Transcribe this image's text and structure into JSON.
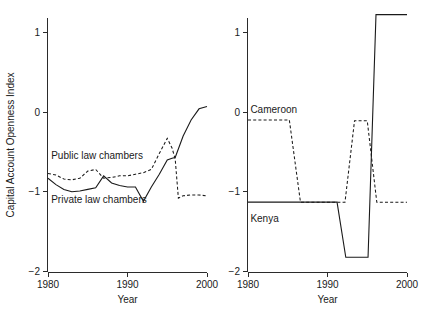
{
  "figure": {
    "width": 443,
    "height": 323,
    "background": "#ffffff",
    "line_color": "#1a1a1a"
  },
  "chart_data": [
    {
      "type": "line",
      "panel": "left",
      "title": "",
      "xlabel": "Year",
      "ylabel": "Capital Account Openness Index",
      "xlim": [
        1980,
        2000
      ],
      "ylim": [
        -2,
        1.35
      ],
      "xticks": [
        1980,
        1990,
        2000
      ],
      "xticklabels": [
        "1980",
        "1990",
        "2000"
      ],
      "yticks": [
        1,
        0,
        -1,
        -2
      ],
      "yticklabels": [
        "1",
        "0",
        "-1",
        "-2"
      ],
      "grid": false,
      "legend_position": "inline-annotations",
      "annotations": [
        {
          "text": "Public law chambers",
          "x": 1980.4,
          "y": -0.54,
          "anchor": "start"
        },
        {
          "text": "Private law chambers",
          "x": 1980.4,
          "y": -1.09,
          "anchor": "start"
        }
      ],
      "series": [
        {
          "name": "Public law chambers",
          "style": "dashed",
          "x": [
            1980,
            1981,
            1982,
            1983,
            1984,
            1985,
            1986,
            1987,
            1988,
            1989,
            1990,
            1991,
            1992,
            1993,
            1994,
            1995,
            1995.6,
            1996,
            1996.4,
            1997,
            1998,
            1999,
            2000
          ],
          "y": [
            -0.77,
            -0.79,
            -0.84,
            -0.85,
            -0.83,
            -0.74,
            -0.72,
            -0.83,
            -0.82,
            -0.8,
            -0.8,
            -0.78,
            -0.76,
            -0.72,
            -0.52,
            -0.33,
            -0.45,
            -0.59,
            -1.08,
            -1.05,
            -1.04,
            -1.04,
            -1.05
          ]
        },
        {
          "name": "Private law chambers",
          "style": "solid",
          "x": [
            1980,
            1981,
            1982,
            1983,
            1984,
            1985,
            1986,
            1987,
            1988,
            1989,
            1990,
            1991,
            1992,
            1993,
            1994,
            1995,
            1995.6,
            1996,
            1997,
            1998,
            1999,
            2000
          ],
          "y": [
            -0.83,
            -0.91,
            -0.97,
            -1.0,
            -0.99,
            -0.97,
            -0.95,
            -0.8,
            -0.89,
            -0.92,
            -0.94,
            -0.94,
            -1.12,
            -0.94,
            -0.78,
            -0.6,
            -0.58,
            -0.57,
            -0.3,
            -0.1,
            0.04,
            0.07
          ]
        }
      ]
    },
    {
      "type": "line",
      "panel": "right",
      "title": "",
      "xlabel": "Year",
      "ylabel": "",
      "xlim": [
        1980,
        2000
      ],
      "ylim": [
        -2,
        1.35
      ],
      "xticks": [
        1980,
        1990,
        2000
      ],
      "xticklabels": [
        "1980",
        "1990",
        "2000"
      ],
      "yticks": [
        1,
        0,
        -1,
        -2
      ],
      "yticklabels": [
        "1",
        "0",
        "-1",
        "-2"
      ],
      "grid": false,
      "legend_position": "inline-annotations",
      "annotations": [
        {
          "text": "Cameroon",
          "x": 1980.3,
          "y": 0.03,
          "anchor": "start"
        },
        {
          "text": "Kenya",
          "x": 1980.3,
          "y": -1.33,
          "anchor": "start"
        }
      ],
      "series": [
        {
          "name": "Cameroon",
          "style": "dashed",
          "x": [
            1980,
            1985.2,
            1986.6,
            1992.2,
            1993.4,
            1995.0,
            1996.2,
            2000
          ],
          "y": [
            -0.1,
            -0.1,
            -1.13,
            -1.13,
            -0.11,
            -0.11,
            -1.13,
            -1.13
          ]
        },
        {
          "name": "Kenya",
          "style": "solid",
          "x": [
            1980,
            1991.2,
            1992.3,
            1995.1,
            1996.1,
            2000
          ],
          "y": [
            -1.13,
            -1.13,
            -1.82,
            -1.82,
            1.22,
            1.22
          ]
        }
      ]
    }
  ]
}
